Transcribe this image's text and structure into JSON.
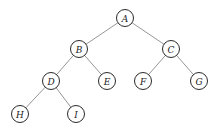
{
  "diagram": {
    "type": "binary-tree",
    "node_radius": 8.5,
    "nodes": [
      {
        "id": "A",
        "label": "A",
        "x": 125,
        "y": 18
      },
      {
        "id": "B",
        "label": "B",
        "x": 79,
        "y": 49
      },
      {
        "id": "C",
        "label": "C",
        "x": 171,
        "y": 49
      },
      {
        "id": "D",
        "label": "D",
        "x": 51,
        "y": 81
      },
      {
        "id": "E",
        "label": "E",
        "x": 107,
        "y": 81
      },
      {
        "id": "F",
        "label": "F",
        "x": 143,
        "y": 81
      },
      {
        "id": "G",
        "label": "G",
        "x": 199,
        "y": 81
      },
      {
        "id": "H",
        "label": "H",
        "x": 20,
        "y": 114
      },
      {
        "id": "I",
        "label": "I",
        "x": 76,
        "y": 114
      }
    ],
    "edges": [
      [
        "A",
        "B"
      ],
      [
        "A",
        "C"
      ],
      [
        "B",
        "D"
      ],
      [
        "B",
        "E"
      ],
      [
        "C",
        "F"
      ],
      [
        "C",
        "G"
      ],
      [
        "D",
        "H"
      ],
      [
        "D",
        "I"
      ]
    ]
  }
}
